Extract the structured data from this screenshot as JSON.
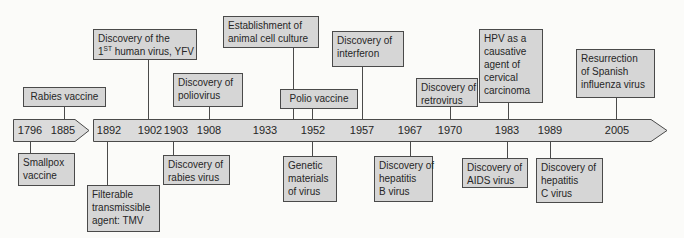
{
  "palette": {
    "background": "#fbfbf9",
    "box_fill": "#d6d6d6",
    "box_border": "#4a4a4a",
    "band_fill": "#dbdbdb",
    "text": "#262626"
  },
  "timeline": {
    "direction": "left-to-right",
    "segment1_years": [
      "1796",
      "1885"
    ],
    "segment2_years": [
      "1892",
      "1902",
      "1903",
      "1908",
      "1933",
      "1952",
      "1957",
      "1967",
      "1970",
      "1983",
      "1989",
      "2005"
    ]
  },
  "events_above": [
    {
      "label": "Rabies vaccine",
      "year": "1885"
    },
    {
      "line1": "Discovery of the",
      "line2_num": "1",
      "line2_sup": "ST",
      "line2_rest": " human virus, YFV",
      "year": "1902"
    },
    {
      "label": "Discovery of\npoliovirus",
      "year": "1908"
    },
    {
      "label": "Establishment of\nanimal cell culture",
      "year": null
    },
    {
      "label": "Polio vaccine",
      "year": "1952"
    },
    {
      "label": "Discovery of\ninterferon",
      "year": "1957"
    },
    {
      "label": "Discovery of\nretrovirus",
      "year": "1970"
    },
    {
      "label": "HPV as a\ncausative\nagent of\ncervical\ncarcinoma",
      "year": "1983"
    },
    {
      "label": "Resurrection\nof Spanish\ninfluenza virus",
      "year": "2005"
    }
  ],
  "events_below": [
    {
      "label": "Smallpox\nvaccine",
      "year": "1796"
    },
    {
      "label": "Filterable\ntransmissible\nagent: TMV",
      "year": "1892"
    },
    {
      "label": "Discovery of\nrabies virus",
      "year": "1903"
    },
    {
      "label": "Genetic\nmaterials\nof virus",
      "year": "1952"
    },
    {
      "label": "Discovery of\nhepatitis\nB virus",
      "year": "1967"
    },
    {
      "label": "Discovery of\nAIDS virus",
      "year": "1983"
    },
    {
      "label": "Discovery of\nhepatitis\nC virus",
      "year": "1989"
    }
  ]
}
